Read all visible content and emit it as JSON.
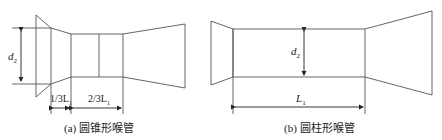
{
  "figure_a": {
    "caption": "(a) 圆锥形喉管",
    "diameter_label": "d",
    "diameter_sub": "2",
    "dim_left_label": "1/3L",
    "dim_left_sub": "1",
    "dim_right_label": "2/3L",
    "dim_right_sub": "1"
  },
  "figure_b": {
    "caption": "(b) 圆柱形喉管",
    "diameter_label": "d",
    "diameter_sub": "2",
    "length_label": "L",
    "length_sub": "1"
  },
  "colors": {
    "line": "#444444",
    "text": "#222222"
  }
}
